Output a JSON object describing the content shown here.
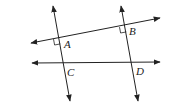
{
  "diagram": {
    "stroke_color": "#222222",
    "points": {
      "A": {
        "label": "A",
        "x": 59,
        "y": 38
      },
      "B": {
        "label": "B",
        "x": 125,
        "y": 26
      },
      "C": {
        "label": "C",
        "x": 63,
        "y": 63
      },
      "D": {
        "label": "D",
        "x": 131,
        "y": 62
      }
    },
    "lines": [
      {
        "name": "line-AB",
        "x1": 31,
        "y1": 43,
        "x2": 160,
        "y2": 18
      },
      {
        "name": "line-CD",
        "x1": 32,
        "y1": 63,
        "x2": 160,
        "y2": 62
      },
      {
        "name": "transversal-AC",
        "x1": 53,
        "y1": 6,
        "x2": 70,
        "y2": 101
      },
      {
        "name": "transversal-BD",
        "x1": 121,
        "y1": 6,
        "x2": 138,
        "y2": 101
      }
    ],
    "right_angle_marks": [
      "A",
      "B"
    ]
  }
}
